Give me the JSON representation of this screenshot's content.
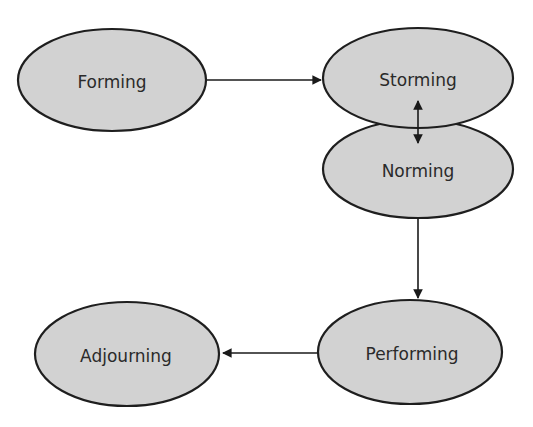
{
  "diagram": {
    "type": "flow",
    "nodes": [
      {
        "id": "forming",
        "label": "Forming"
      },
      {
        "id": "storming",
        "label": "Storming"
      },
      {
        "id": "norming",
        "label": "Norming"
      },
      {
        "id": "performing",
        "label": "Performing"
      },
      {
        "id": "adjourning",
        "label": "Adjourning"
      }
    ],
    "edges": [
      {
        "from": "forming",
        "to": "storming",
        "direction": "forward"
      },
      {
        "from": "storming",
        "to": "norming",
        "direction": "bidirectional"
      },
      {
        "from": "norming",
        "to": "performing",
        "direction": "forward"
      },
      {
        "from": "performing",
        "to": "adjourning",
        "direction": "forward"
      }
    ],
    "colors": {
      "node_fill": "#d2d2d2",
      "node_stroke": "#1e1e1e",
      "edge": "#1a1a1a",
      "text": "#2a2a2a",
      "background": "#ffffff"
    }
  }
}
